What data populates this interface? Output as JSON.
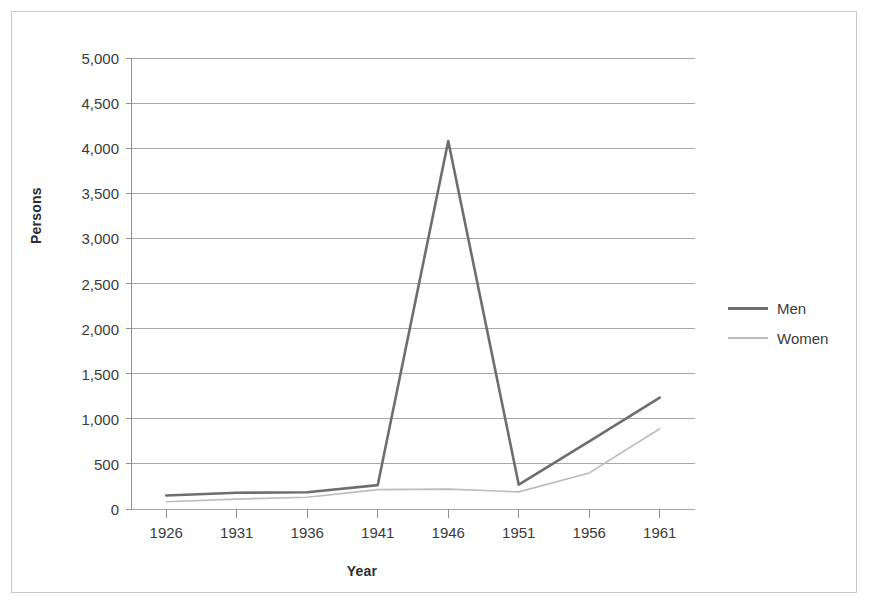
{
  "chart_data": {
    "type": "line",
    "title": "",
    "xlabel": "Year",
    "ylabel": "Persons",
    "x": [
      1926,
      1931,
      1936,
      1941,
      1946,
      1951,
      1956,
      1961
    ],
    "categories": [
      "1926",
      "1931",
      "1936",
      "1941",
      "1946",
      "1951",
      "1956",
      "1961"
    ],
    "series": [
      {
        "name": "Men",
        "color": "#6e6e6e",
        "line_width": 2.6,
        "values": [
          150,
          180,
          185,
          265,
          4080,
          270,
          750,
          1235
        ]
      },
      {
        "name": "Women",
        "color": "#bcbcbc",
        "line_width": 1.6,
        "values": [
          80,
          110,
          130,
          215,
          220,
          190,
          400,
          890
        ]
      }
    ],
    "ylim": [
      0,
      5000
    ],
    "ytick_step": 500,
    "ytick_labels": [
      "5,000",
      "4,500",
      "4,000",
      "3,500",
      "3,000",
      "2,500",
      "2,000",
      "1,500",
      "1,000",
      "500",
      "0"
    ],
    "ytick_values": [
      5000,
      4500,
      4000,
      3500,
      3000,
      2500,
      2000,
      1500,
      1000,
      500,
      0
    ],
    "xtick_labels": [
      "1926",
      "1931",
      "1936",
      "1941",
      "1946",
      "1951",
      "1956",
      "1961"
    ],
    "grid": true,
    "grid_orientation": "horizontal",
    "grid_color": "#a8a8a8",
    "axis_color": "#8f8f8f",
    "legend_position": "right",
    "legend_entries": [
      "Men",
      "Women"
    ],
    "background_color": "#ffffff",
    "border_color": "#c9c9c9"
  },
  "axis": {
    "y_title": "Persons",
    "x_title": "Year"
  },
  "legend": {
    "items": [
      {
        "label": "Men"
      },
      {
        "label": "Women"
      }
    ]
  }
}
